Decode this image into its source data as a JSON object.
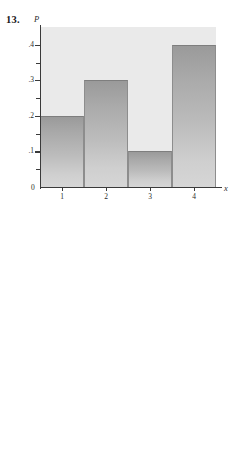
{
  "page": {
    "background": "#ffffff",
    "panel_color": "#eaeaea",
    "axis_color": "#3a3a3a"
  },
  "figures": [
    {
      "number": "13.",
      "y_axis_title": "P",
      "x_axis_title": "x",
      "zero_label": "0",
      "chart_data": {
        "type": "bar",
        "title": "",
        "xlabel": "x",
        "ylabel": "P",
        "categories": [
          "1",
          "2",
          "3",
          "4"
        ],
        "values": [
          0.2,
          0.3,
          0.1,
          0.4
        ],
        "value_labels": [
          ".2",
          ".3",
          ".1",
          ".4"
        ],
        "x": [
          1,
          2,
          3,
          4
        ],
        "xlim": [
          0.5,
          4.5
        ],
        "ylim": [
          0,
          0.45
        ],
        "ytick_labels": [
          ".4",
          ".3",
          ".2",
          ".1",
          "0"
        ],
        "ytick_values": [
          0.4,
          0.3,
          0.2,
          0.1,
          0
        ],
        "yminor_values": [
          0.35,
          0.25,
          0.15,
          0.05
        ],
        "xtick_labels": [
          "1",
          "2",
          "3",
          "4"
        ],
        "xtick_values": [
          1,
          2,
          3,
          4
        ],
        "grid": false,
        "legend": "none",
        "bar_width": 1,
        "bar_fill": "vertical-gradient-gray"
      }
    },
    {
      "number": "14.",
      "y_axis_title": "P",
      "x_axis_title": "x",
      "zero_label": "0",
      "chart_data": {
        "type": "bar",
        "title": "",
        "xlabel": "x",
        "ylabel": "P",
        "categories": [
          "2",
          "4",
          "6",
          "8",
          "10"
        ],
        "values": [
          0.2,
          0.3,
          0.2,
          0.1,
          0.2
        ],
        "value_labels": [
          ".2",
          ".3",
          ".2",
          ".1",
          ".2"
        ],
        "x": [
          2,
          4,
          6,
          8,
          10
        ],
        "xlim": [
          1,
          11
        ],
        "ylim": [
          0,
          0.33
        ],
        "ytick_labels": [
          ".3",
          ".2",
          ".1",
          "0"
        ],
        "ytick_values": [
          0.3,
          0.2,
          0.1,
          0
        ],
        "yminor_values": [
          0.25,
          0.15,
          0.05
        ],
        "xtick_labels": [
          "2",
          "4",
          "6",
          "8",
          "10"
        ],
        "xtick_values": [
          2,
          4,
          6,
          8,
          10
        ],
        "grid": false,
        "legend": "none",
        "bar_width": 2,
        "bar_fill": "vertical-gradient-gray"
      }
    }
  ]
}
